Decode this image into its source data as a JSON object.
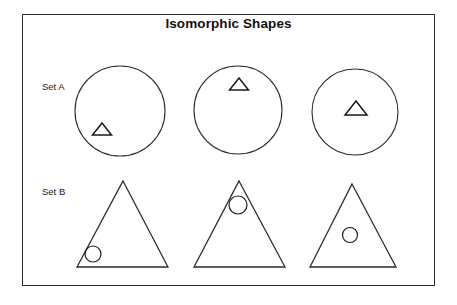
{
  "figure": {
    "title": "Isomorphic Shapes",
    "frame": {
      "x": 22,
      "y": 14,
      "width": 413,
      "height": 272,
      "stroke": "#2b2b2b"
    },
    "background": "#ffffff",
    "stroke_color": "#2b2b2b",
    "text_color": "#111111"
  },
  "rows": [
    {
      "id": "set-a",
      "label": "Set A",
      "label_x": 42,
      "label_y": 81,
      "outer_shape": "circle",
      "inner_shape": "triangle"
    },
    {
      "id": "set-b",
      "label": "Set B",
      "label_x": 42,
      "label_y": 186,
      "outer_shape": "triangle",
      "inner_shape": "circle"
    }
  ],
  "set_a": {
    "label": "Set A",
    "items": [
      {
        "name": "circle-with-triangle-lower-left",
        "outer": {
          "type": "circle",
          "cx": 120,
          "cy": 111,
          "r": 45
        },
        "inner": {
          "type": "triangle",
          "cx": 102,
          "cy": 129,
          "half_width": 9.5,
          "height": 12
        },
        "inner_position": "lower-left"
      },
      {
        "name": "circle-with-triangle-top",
        "outer": {
          "type": "circle",
          "cx": 238,
          "cy": 110,
          "r": 44
        },
        "inner": {
          "type": "triangle",
          "cx": 239,
          "cy": 84,
          "half_width": 9.5,
          "height": 12
        },
        "inner_position": "top"
      },
      {
        "name": "circle-with-triangle-center",
        "outer": {
          "type": "circle",
          "cx": 355,
          "cy": 112,
          "r": 43
        },
        "inner": {
          "type": "triangle",
          "cx": 356,
          "cy": 108,
          "half_width": 11,
          "height": 14
        },
        "inner_position": "center"
      }
    ]
  },
  "set_b": {
    "label": "Set B",
    "items": [
      {
        "name": "triangle-with-circle-lower-left",
        "outer": {
          "type": "triangle",
          "apex_x": 123,
          "apex_y": 181,
          "base_left_x": 77,
          "base_right_x": 168,
          "base_y": 267
        },
        "inner": {
          "type": "circle",
          "cx": 93,
          "cy": 254,
          "r": 8
        },
        "inner_position": "lower-left"
      },
      {
        "name": "triangle-with-circle-top",
        "outer": {
          "type": "triangle",
          "apex_x": 239,
          "apex_y": 181,
          "base_left_x": 194,
          "base_right_x": 285,
          "base_y": 267
        },
        "inner": {
          "type": "circle",
          "cx": 238,
          "cy": 205,
          "r": 9
        },
        "inner_position": "top"
      },
      {
        "name": "triangle-with-circle-center",
        "outer": {
          "type": "triangle",
          "apex_x": 352,
          "apex_y": 184,
          "base_left_x": 310,
          "base_right_x": 396,
          "base_y": 267
        },
        "inner": {
          "type": "circle",
          "cx": 350,
          "cy": 235,
          "r": 7.5
        },
        "inner_position": "center"
      }
    ]
  }
}
